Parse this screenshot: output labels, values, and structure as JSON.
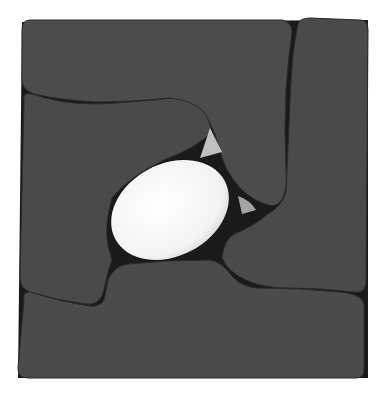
{
  "image": {
    "subject": "modular cushion seating composed of four interlocking dark gray pieces around a white oval cushion",
    "colors": {
      "background": "#ffffff",
      "cushion": "#4a4a4a",
      "cushion_edge": "#2b2b2b",
      "center_oval": "#f7f7f7",
      "gap": "#111111"
    }
  }
}
